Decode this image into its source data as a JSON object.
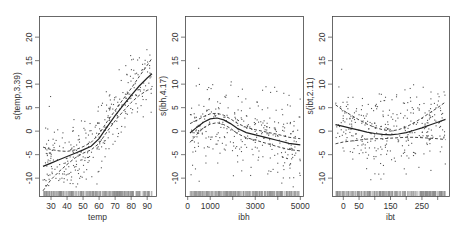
{
  "chart_data": [
    {
      "type": "scatter",
      "title": "",
      "xlabel": "temp",
      "ylabel": "s(temp,3.39)",
      "xticks": [
        30,
        40,
        50,
        60,
        70,
        80,
        90
      ],
      "xtick_labels": [
        "30",
        "40",
        "50",
        "60",
        "70",
        "80",
        "90"
      ],
      "xlim": [
        22.5,
        95.5
      ],
      "yticks": [
        -10,
        -5,
        0,
        5,
        10,
        15,
        20
      ],
      "ytick_labels": [
        "-10",
        "-5",
        "0",
        "5",
        "10",
        "15",
        "20"
      ],
      "ylim": [
        -13.8,
        24.5
      ],
      "grid": false,
      "legend": null,
      "smooth": {
        "x": [
          25,
          30,
          35,
          40,
          45,
          50,
          55,
          60,
          65,
          70,
          75,
          80,
          85,
          90,
          93
        ],
        "fit": [
          -7.5,
          -6.8,
          -6.1,
          -5.4,
          -4.7,
          -4.0,
          -3.2,
          -1.6,
          0.9,
          3.3,
          5.5,
          7.6,
          9.6,
          11.3,
          12.2
        ],
        "upper": [
          -3.4,
          -3.9,
          -4.2,
          -4.3,
          -4.0,
          -3.3,
          -2.4,
          -0.6,
          2.0,
          4.4,
          6.8,
          9.1,
          11.6,
          14.0,
          15.5
        ],
        "lower": [
          -12.7,
          -10.3,
          -8.6,
          -7.1,
          -5.7,
          -4.7,
          -4.0,
          -2.6,
          -0.1,
          2.2,
          4.2,
          6.1,
          7.6,
          8.7,
          9.0
        ]
      },
      "residuals": {
        "n": 330,
        "x_range": [
          25,
          93
        ],
        "spread": 4.0,
        "seed": 11
      },
      "rug": {
        "x_range": [
          25,
          93
        ],
        "n": 330
      }
    },
    {
      "type": "scatter",
      "title": "",
      "xlabel": "ibh",
      "ylabel": "s(ibh,4.17)",
      "xticks": [
        0,
        1000,
        2000,
        3000,
        4000,
        5000
      ],
      "xtick_labels": [
        "0",
        "1000",
        "",
        "3000",
        "",
        "5000"
      ],
      "xlim": [
        -120,
        5120
      ],
      "yticks": [
        -10,
        -5,
        0,
        5,
        10,
        15,
        20
      ],
      "ytick_labels": [
        "-10",
        "-5",
        "0",
        "5",
        "10",
        "15",
        "20"
      ],
      "ylim": [
        -13.8,
        24.5
      ],
      "grid": false,
      "legend": null,
      "smooth": {
        "x": [
          100,
          400,
          700,
          1000,
          1300,
          1600,
          1900,
          2200,
          2600,
          3000,
          3500,
          4000,
          4500,
          5000
        ],
        "fit": [
          -0.4,
          0.8,
          1.9,
          2.6,
          2.8,
          2.4,
          1.6,
          0.6,
          -0.3,
          -0.8,
          -1.4,
          -2.0,
          -2.6,
          -2.9
        ],
        "upper": [
          1.6,
          2.3,
          3.1,
          3.7,
          3.8,
          3.4,
          2.6,
          1.7,
          0.8,
          0.3,
          -0.2,
          -0.7,
          -1.3,
          -1.6
        ],
        "lower": [
          -2.4,
          -0.7,
          0.7,
          1.5,
          1.8,
          1.4,
          0.6,
          -0.5,
          -1.4,
          -1.9,
          -2.6,
          -3.3,
          -3.9,
          -4.2
        ]
      },
      "residuals": {
        "n": 330,
        "x_range": [
          100,
          5000
        ],
        "spread": 4.3,
        "seed": 23
      },
      "rug": {
        "x_range": [
          100,
          5000
        ],
        "n": 330
      }
    },
    {
      "type": "scatter",
      "title": "",
      "xlabel": "ibt",
      "ylabel": "s(ibt,2.11)",
      "xticks": [
        0,
        50,
        100,
        150,
        200,
        250,
        300
      ],
      "xtick_labels": [
        "0",
        "50",
        "",
        "150",
        "",
        "250",
        ""
      ],
      "xlim": [
        -36,
        336
      ],
      "yticks": [
        -10,
        -5,
        0,
        5,
        10,
        15,
        20
      ],
      "ytick_labels": [
        "-10",
        "-5",
        "0",
        "5",
        "10",
        "15",
        "20"
      ],
      "ylim": [
        -13.8,
        24.5
      ],
      "grid": false,
      "legend": null,
      "smooth": {
        "x": [
          -25,
          0,
          25,
          50,
          75,
          100,
          125,
          150,
          175,
          200,
          225,
          250,
          275,
          300,
          325
        ],
        "fit": [
          1.4,
          1.0,
          0.6,
          0.2,
          -0.2,
          -0.5,
          -0.7,
          -0.8,
          -0.6,
          -0.3,
          0.2,
          0.7,
          1.3,
          1.9,
          2.5
        ],
        "upper": [
          5.6,
          4.4,
          3.4,
          2.4,
          1.5,
          0.8,
          0.3,
          0.0,
          0.3,
          0.9,
          1.8,
          2.8,
          3.9,
          5.0,
          6.2
        ],
        "lower": [
          -2.7,
          -2.3,
          -2.1,
          -1.9,
          -1.7,
          -1.6,
          -1.6,
          -1.5,
          -1.4,
          -1.3,
          -1.3,
          -1.4,
          -1.5,
          -1.6,
          -1.8
        ]
      },
      "residuals": {
        "n": 330,
        "x_range": [
          -25,
          325
        ],
        "spread": 4.0,
        "seed": 37
      },
      "rug": {
        "x_range": [
          -25,
          325
        ],
        "n": 330
      }
    }
  ],
  "layout": {
    "panels": [
      {
        "left": 39,
        "top": 16,
        "right": 156,
        "bottom": 196
      },
      {
        "left": 185,
        "top": 16,
        "right": 303,
        "bottom": 196
      },
      {
        "left": 332,
        "top": 16,
        "right": 449,
        "bottom": 196
      }
    ]
  }
}
